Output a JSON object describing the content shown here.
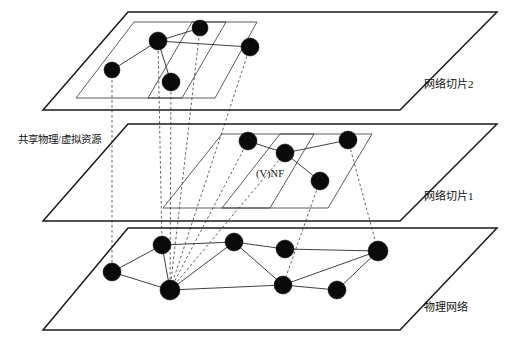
{
  "figure": {
    "type": "network-slicing-layered-diagram",
    "background": "#ffffff",
    "node_color": "#0a0a0a",
    "line_color": "#2a2a2a",
    "mapping_line_color": "#3a3a3a",
    "width": 511,
    "height": 338
  },
  "labels": {
    "slice2": "网络切片2",
    "slice1": "网络切片1",
    "physical": "物理网络",
    "shared_resource": "共享物理/虚拟资源",
    "vnf": "(V)NF"
  },
  "layers": [
    {
      "id": "slice2",
      "label": "网络切片2",
      "label_pos": [
        424,
        88
      ],
      "outline": [
        [
          128,
          12
        ],
        [
          497,
          12
        ],
        [
          400,
          110
        ],
        [
          43,
          110
        ]
      ],
      "subplanes": [
        [
          [
            134,
            22
          ],
          [
            226,
            22
          ],
          [
            182,
            98
          ],
          [
            76,
            98
          ]
        ],
        [
          [
            192,
            22
          ],
          [
            257,
            22
          ],
          [
            215,
            98
          ],
          [
            148,
            98
          ]
        ]
      ],
      "nodes": [
        {
          "id": "s2n1",
          "x": 112,
          "y": 70,
          "r": 8
        },
        {
          "id": "s2n2",
          "x": 158,
          "y": 41,
          "r": 9
        },
        {
          "id": "s2n3",
          "x": 200,
          "y": 28,
          "r": 8
        },
        {
          "id": "s2n4",
          "x": 171,
          "y": 82,
          "r": 9
        },
        {
          "id": "s2n5",
          "x": 250,
          "y": 47,
          "r": 9
        }
      ],
      "links": [
        [
          "s2n1",
          "s2n2"
        ],
        [
          "s2n2",
          "s2n3"
        ],
        [
          "s2n2",
          "s2n4"
        ],
        [
          "s2n2",
          "s2n5"
        ]
      ]
    },
    {
      "id": "slice1",
      "label": "网络切片1",
      "label_pos": [
        424,
        200
      ],
      "outline": [
        [
          128,
          124
        ],
        [
          497,
          124
        ],
        [
          400,
          221
        ],
        [
          43,
          221
        ]
      ],
      "subplanes": [
        [
          [
            222,
            134
          ],
          [
            314,
            134
          ],
          [
            270,
            208
          ],
          [
            163,
            208
          ]
        ],
        [
          [
            280,
            134
          ],
          [
            372,
            134
          ],
          [
            328,
            208
          ],
          [
            222,
            208
          ]
        ]
      ],
      "nodes": [
        {
          "id": "s1n1",
          "x": 248,
          "y": 141,
          "r": 9
        },
        {
          "id": "s1n2",
          "x": 285,
          "y": 153,
          "r": 9
        },
        {
          "id": "s1n3",
          "x": 348,
          "y": 140,
          "r": 9
        },
        {
          "id": "s1n4",
          "x": 320,
          "y": 181,
          "r": 9
        }
      ],
      "links": [
        [
          "s1n1",
          "s1n2"
        ],
        [
          "s1n2",
          "s1n3"
        ],
        [
          "s1n2",
          "s1n4"
        ]
      ]
    },
    {
      "id": "physical",
      "label": "物理网络",
      "label_pos": [
        424,
        311
      ],
      "outline": [
        [
          128,
          228
        ],
        [
          497,
          228
        ],
        [
          400,
          330
        ],
        [
          43,
          330
        ]
      ],
      "subplanes": [],
      "nodes": [
        {
          "id": "p1",
          "x": 112,
          "y": 272,
          "r": 9
        },
        {
          "id": "p2",
          "x": 162,
          "y": 245,
          "r": 9
        },
        {
          "id": "p3",
          "x": 170,
          "y": 290,
          "r": 10
        },
        {
          "id": "p4",
          "x": 234,
          "y": 242,
          "r": 9
        },
        {
          "id": "p5",
          "x": 285,
          "y": 249,
          "r": 9
        },
        {
          "id": "p6",
          "x": 378,
          "y": 251,
          "r": 10
        },
        {
          "id": "p7",
          "x": 283,
          "y": 285,
          "r": 9
        },
        {
          "id": "p8",
          "x": 337,
          "y": 290,
          "r": 9
        }
      ],
      "links": [
        [
          "p1",
          "p2"
        ],
        [
          "p1",
          "p3"
        ],
        [
          "p2",
          "p3"
        ],
        [
          "p2",
          "p4"
        ],
        [
          "p3",
          "p4"
        ],
        [
          "p3",
          "p7"
        ],
        [
          "p4",
          "p5"
        ],
        [
          "p4",
          "p7"
        ],
        [
          "p5",
          "p6"
        ],
        [
          "p6",
          "p7"
        ],
        [
          "p6",
          "p8"
        ],
        [
          "p7",
          "p8"
        ]
      ]
    }
  ],
  "mappings": [
    {
      "from": [
        112,
        70
      ],
      "to": [
        112,
        272
      ]
    },
    {
      "from": [
        158,
        41
      ],
      "to": [
        162,
        245
      ]
    },
    {
      "from": [
        171,
        82
      ],
      "to": [
        170,
        290
      ]
    },
    {
      "from": [
        200,
        28
      ],
      "to": [
        170,
        290
      ]
    },
    {
      "from": [
        250,
        47
      ],
      "to": [
        170,
        290
      ]
    },
    {
      "from": [
        248,
        141
      ],
      "to": [
        170,
        290
      ]
    },
    {
      "from": [
        285,
        153
      ],
      "to": [
        170,
        290
      ]
    },
    {
      "from": [
        320,
        181
      ],
      "to": [
        283,
        285
      ]
    },
    {
      "from": [
        348,
        140
      ],
      "to": [
        378,
        251
      ]
    }
  ]
}
